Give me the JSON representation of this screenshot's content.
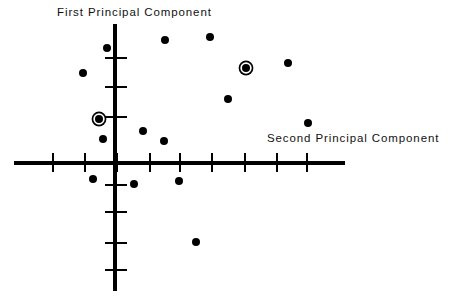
{
  "figure": {
    "type": "scatter",
    "background_color": "#ffffff",
    "ink_color": "#000000",
    "width": 468,
    "height": 306
  },
  "labels": {
    "y_axis_title": "First Principal Component",
    "x_axis_title": "Second Principal Component"
  },
  "chart_data": {
    "type": "scatter",
    "title": "",
    "xlabel": "Second Principal Component",
    "ylabel": "First Principal Component",
    "grid": false,
    "legend": "none",
    "axes": {
      "origin_px": [
        115,
        163
      ],
      "x_axis_extent_px": [
        14,
        345
      ],
      "y_axis_extent_px": [
        24,
        291
      ],
      "x_tick_spacing_px": 32,
      "y_tick_spacing_px": 29,
      "x_tick_positions_px": [
        53,
        85,
        117,
        150,
        180,
        212,
        245,
        277,
        307
      ],
      "y_tick_positions_px": [
        58,
        87,
        117,
        185,
        212,
        243,
        270
      ],
      "tick_labels_shown": false,
      "x_ticks_units": [
        -2,
        -1.5,
        -1,
        -0.5,
        0,
        0.5,
        1,
        1.5,
        2
      ],
      "y_ticks_units": [
        2,
        1.5,
        1,
        -1,
        -1.5,
        -2,
        -2.5
      ]
    },
    "series": [
      {
        "name": "observations",
        "marker": "filled-circle",
        "color": "#000000",
        "points": [
          {
            "id": "p1",
            "px": [
              107,
              48
            ],
            "x": -0.25,
            "y": 1.98,
            "highlighted": false
          },
          {
            "id": "p2",
            "px": [
              165,
              40
            ],
            "x": 0.78,
            "y": 2.12,
            "highlighted": false
          },
          {
            "id": "p3",
            "px": [
              210,
              37
            ],
            "x": 1.48,
            "y": 2.17,
            "highlighted": false
          },
          {
            "id": "p4",
            "px": [
              83,
              73
            ],
            "x": -0.5,
            "y": 1.55,
            "highlighted": false
          },
          {
            "id": "p5",
            "px": [
              246,
              68
            ],
            "x": 2.05,
            "y": 1.64,
            "highlighted": true
          },
          {
            "id": "p6",
            "px": [
              288,
              63
            ],
            "x": 2.7,
            "y": 1.72,
            "highlighted": false
          },
          {
            "id": "p7",
            "px": [
              228,
              99
            ],
            "x": 1.77,
            "y": 1.1,
            "highlighted": false
          },
          {
            "id": "p8",
            "px": [
              99,
              119
            ],
            "x": -0.25,
            "y": 0.76,
            "highlighted": true
          },
          {
            "id": "p9",
            "px": [
              308,
              123
            ],
            "x": 3.02,
            "y": 0.69,
            "highlighted": false
          },
          {
            "id": "p10",
            "px": [
              143,
              131
            ],
            "x": 0.44,
            "y": 0.55,
            "highlighted": false
          },
          {
            "id": "p11",
            "px": [
              103,
              139
            ],
            "x": -0.19,
            "y": 0.41,
            "highlighted": false
          },
          {
            "id": "p12",
            "px": [
              164,
              141
            ],
            "x": 0.77,
            "y": 0.38,
            "highlighted": false
          },
          {
            "id": "p13",
            "px": [
              93,
              179
            ],
            "x": -0.34,
            "y": -0.28,
            "highlighted": false
          },
          {
            "id": "p14",
            "px": [
              179,
              181
            ],
            "x": 1.0,
            "y": -0.31,
            "highlighted": false
          },
          {
            "id": "p15",
            "px": [
              134,
              184
            ],
            "x": 0.3,
            "y": -0.36,
            "highlighted": false
          },
          {
            "id": "p16",
            "px": [
              196,
              242
            ],
            "x": 1.27,
            "y": -1.36,
            "highlighted": false
          }
        ]
      }
    ],
    "highlighted_point_ids": [
      "p5",
      "p8"
    ],
    "highlight_style": "filled circle with surrounding ring"
  }
}
